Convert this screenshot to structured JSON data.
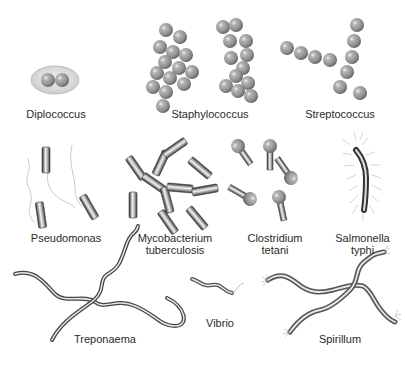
{
  "diagram": {
    "colors": {
      "cell_fill": "#9a9a9a",
      "cell_highlight": "#e6e6e6",
      "cell_shadow": "#5a5a5a",
      "capsule": "#d8d8d8",
      "label": "#2a2a2a"
    },
    "organisms": [
      {
        "id": "diplococcus",
        "label": "Diplococcus",
        "shape": "paired cocci in capsule"
      },
      {
        "id": "staphylococcus",
        "label": "Staphylococcus",
        "shape": "grape-like clusters of cocci"
      },
      {
        "id": "streptococcus",
        "label": "Streptococcus",
        "shape": "chains of cocci"
      },
      {
        "id": "pseudomonas",
        "label": "Pseudomonas",
        "shape": "rods with polar flagellum"
      },
      {
        "id": "mycobacterium",
        "label_line1": "Mycobacterium",
        "label_line2": "tuberculosis",
        "shape": "branching rods"
      },
      {
        "id": "clostridium",
        "label_line1": "Clostridium",
        "label_line2": "tetani",
        "shape": "rods with terminal spore"
      },
      {
        "id": "salmonella",
        "label_line1": "Salmonella",
        "label_line2": "typhi",
        "shape": "peritrichous flagellated rod"
      },
      {
        "id": "treponaema",
        "label": "Treponaema",
        "shape": "spirochetes"
      },
      {
        "id": "vibrio",
        "label": "Vibrio",
        "shape": "comma-shaped rod"
      },
      {
        "id": "spirillum",
        "label": "Spirillum",
        "shape": "spiral with tufted flagella"
      }
    ]
  }
}
